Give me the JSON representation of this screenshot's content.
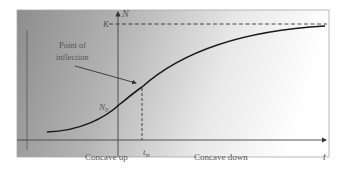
{
  "diagram": {
    "type": "logistic-growth-curve",
    "labels": {
      "y_axis": "N",
      "x_axis": "t",
      "carrying_capacity": "K",
      "initial_population": "N",
      "initial_population_sub": "0",
      "inflection_time": "t",
      "inflection_time_sub": "m",
      "inflection_annotation_line1": "Point of",
      "inflection_annotation_line2": "inflection",
      "region_left": "Concave up",
      "region_right": "Concave down"
    },
    "colors": {
      "background_left": "#8f8f8f",
      "background_right": "#ffffff",
      "curve": "#1a1a1a",
      "axis": "#444444",
      "frame": "#9a9a9a"
    }
  }
}
